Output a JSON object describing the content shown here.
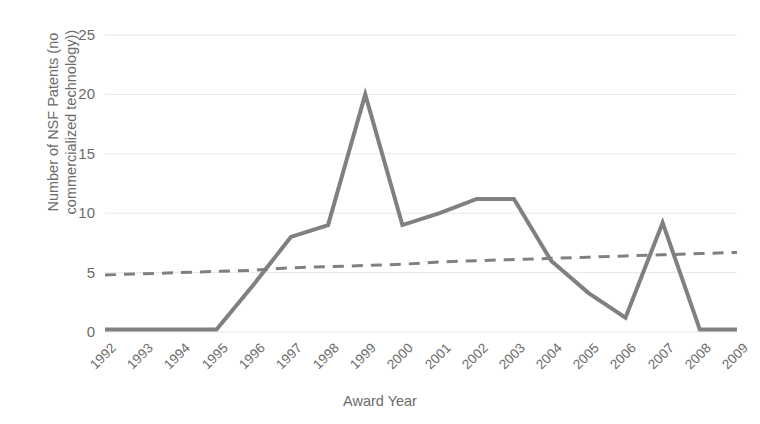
{
  "chart_data": {
    "type": "line",
    "title": "",
    "xlabel": "Award Year",
    "ylabel": "Number of NSF Patents (no commercialized technology))",
    "categories": [
      "1992",
      "1993",
      "1994",
      "1995",
      "1996",
      "1997",
      "1998",
      "1999",
      "2000",
      "2001",
      "2002",
      "2003",
      "2004",
      "2005",
      "2006",
      "2007",
      "2008",
      "2009"
    ],
    "series": [
      {
        "name": "NSF Patents (no commercialized technology)",
        "style": "solid",
        "color": "#808080",
        "values": [
          0.2,
          0.2,
          0.2,
          0.2,
          4.0,
          8.0,
          9.0,
          20.0,
          9.0,
          10.0,
          11.2,
          11.2,
          6.0,
          3.3,
          1.2,
          9.2,
          0.2,
          0.2
        ]
      },
      {
        "name": "Linear trendline",
        "style": "dashed",
        "color": "#808080",
        "values": [
          4.8,
          4.9,
          5.0,
          5.1,
          5.2,
          5.4,
          5.5,
          5.6,
          5.7,
          5.9,
          6.0,
          6.1,
          6.2,
          6.3,
          6.4,
          6.5,
          6.6,
          6.7
        ]
      }
    ],
    "yticks": [
      0,
      5,
      10,
      15,
      20,
      25
    ],
    "ylim": [
      0,
      25
    ],
    "xlim_categories": [
      "1992",
      "2009"
    ],
    "grid": "horizontal",
    "legend": "none",
    "gridline_color": "#e8e8e8",
    "text_color": "#6b6b6b"
  },
  "axis": {
    "y_title": "Number of NSF Patents (no commercialized technology))",
    "x_title": "Award Year"
  }
}
